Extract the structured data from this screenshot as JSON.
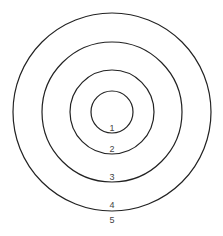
{
  "diagram": {
    "type": "concentric-circles",
    "center": [
      112,
      112
    ],
    "stroke_color": "#222222",
    "rings": [
      {
        "label": "1",
        "radius": 21
      },
      {
        "label": "2",
        "radius": 42
      },
      {
        "label": "3",
        "radius": 70
      },
      {
        "label": "4",
        "radius": 99
      }
    ],
    "outer_label": "5"
  }
}
